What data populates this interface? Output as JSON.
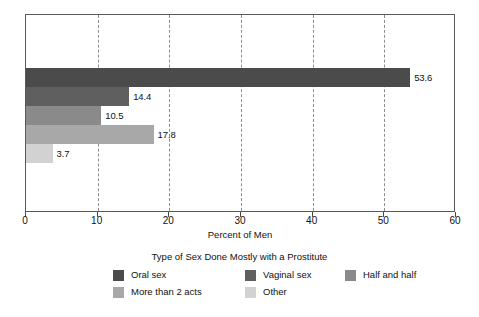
{
  "chart_data": {
    "type": "bar",
    "orientation": "horizontal",
    "title": "",
    "xlabel": "Percent of Men",
    "ylabel": "",
    "xlim": [
      0,
      60
    ],
    "xticks": [
      0,
      10,
      20,
      30,
      40,
      50,
      60
    ],
    "xtick_labels": [
      "0",
      "10",
      "20",
      "30",
      "40",
      "50",
      "60"
    ],
    "grid": "vertical-dashed",
    "legend_position": "bottom",
    "legend_title": "Type of Sex Done Mostly with a Prostitute",
    "categories": [
      "Oral sex",
      "Vaginal sex",
      "Half and half",
      "More than 2 acts",
      "Other"
    ],
    "values": [
      53.6,
      14.4,
      10.5,
      17.8,
      3.7
    ],
    "value_labels": [
      "53.6",
      "14.4",
      "10.5",
      "17.8",
      "3.7"
    ],
    "colors": [
      "#4b4b4b",
      "#5f5f5f",
      "#8a8a8a",
      "#a8a8a8",
      "#d2d2d2"
    ],
    "bars": [
      {
        "category": "Oral sex",
        "value": 53.6,
        "label": "53.6",
        "color": "#4b4b4b"
      },
      {
        "category": "Vaginal sex",
        "value": 14.4,
        "label": "14.4",
        "color": "#5f5f5f"
      },
      {
        "category": "Half and half",
        "value": 10.5,
        "label": "10.5",
        "color": "#8a8a8a"
      },
      {
        "category": "More than 2 acts",
        "value": 17.8,
        "label": "17.8",
        "color": "#a8a8a8"
      },
      {
        "category": "Other",
        "value": 3.7,
        "label": "3.7",
        "color": "#d2d2d2"
      }
    ]
  },
  "axis": {
    "x_title": "Percent of Men",
    "ticks": [
      "0",
      "10",
      "20",
      "30",
      "40",
      "50",
      "60"
    ]
  },
  "legend": {
    "title": "Type of Sex Done Mostly with a Prostitute",
    "items": [
      {
        "label": "Oral sex",
        "color": "#4b4b4b"
      },
      {
        "label": "Vaginal sex",
        "color": "#5f5f5f"
      },
      {
        "label": "Half and half",
        "color": "#8a8a8a"
      },
      {
        "label": "More than 2 acts",
        "color": "#a8a8a8"
      },
      {
        "label": "Other",
        "color": "#d2d2d2"
      }
    ]
  }
}
